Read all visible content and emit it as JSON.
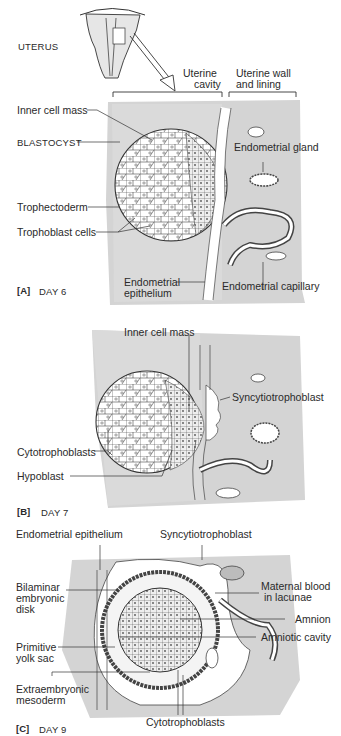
{
  "panel_a": {
    "uterus_label": "UTERUS",
    "uterine_cavity": [
      "Uterine",
      "cavity"
    ],
    "uterine_wall": [
      "Uterine wall",
      "and lining"
    ],
    "inner_cell_mass": "Inner cell mass",
    "blastocyst": "BLASTOCYST",
    "endometrial_gland": "Endometrial gland",
    "trophectoderm": "Trophectoderm",
    "trophoblast_cells": "Trophoblast cells",
    "endometrial_epithelium": [
      "Endometrial",
      "epithelium"
    ],
    "endometrial_capillary": "Endometrial capillary",
    "panel_tag": "[A]",
    "panel_day": "DAY 6"
  },
  "panel_b": {
    "inner_cell_mass": "Inner cell mass",
    "syncytiotrophoblast": "Syncytiotrophoblast",
    "cytotrophoblasts": "Cytotrophoblasts",
    "hypoblast": "Hypoblast",
    "panel_tag": "[B]",
    "panel_day": "DAY 7"
  },
  "panel_c": {
    "endometrial_epithelium": "Endometrial epithelium",
    "syncytiotrophoblast": "Syncytiotrophoblast",
    "bilaminar_disk": [
      "Bilaminar",
      "embryonic",
      "disk"
    ],
    "maternal_blood": [
      "Maternal blood",
      "in lacunae"
    ],
    "amnion": "Amnion",
    "amniotic_cavity": "Amniotic cavity",
    "primitive_yolk_sac": [
      "Primitive",
      "yolk sac"
    ],
    "extraembryonic_mesoderm": [
      "Extraembryonic",
      "mesoderm"
    ],
    "cytotrophoblasts": "Cytotrophoblasts",
    "panel_tag": "[C]",
    "panel_day": "DAY 9"
  },
  "colors": {
    "tissue_gray": "#d4d4d4",
    "line": "#333333",
    "cell_fill": "#ffffff"
  }
}
